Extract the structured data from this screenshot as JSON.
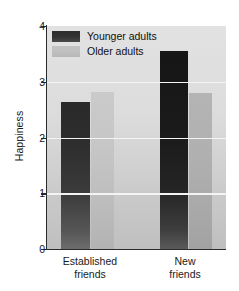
{
  "chart_data": {
    "type": "bar",
    "title": "",
    "xlabel": "",
    "ylabel": "Happiness",
    "ylim": [
      0,
      4
    ],
    "yticks": [
      0,
      1,
      2,
      3,
      4
    ],
    "ytick_labels": [
      "0",
      "1",
      "2",
      "3",
      "4"
    ],
    "grid": true,
    "grid_axis": "y",
    "legend_position": "upper-left-inside",
    "categories": [
      "Established friends",
      "New friends"
    ],
    "category_lines": [
      [
        "Established",
        "friends"
      ],
      [
        "New",
        "friends"
      ]
    ],
    "series": [
      {
        "name": "Younger adults",
        "color": "#2e2e2e",
        "values": [
          2.63,
          3.56
        ]
      },
      {
        "name": "Older adults",
        "color": "#c0c0c0",
        "values": [
          2.82,
          2.8
        ]
      }
    ]
  },
  "legend": {
    "items": [
      {
        "label": "Younger adults",
        "swatch": "younger"
      },
      {
        "label": "Older adults",
        "swatch": "older"
      }
    ]
  },
  "axis": {
    "y_title": "Happiness",
    "y_tick_4": "4",
    "y_tick_3": "3",
    "y_tick_2": "2",
    "y_tick_1": "1",
    "y_tick_0": "0"
  },
  "xlabels": {
    "group1_line1": "Established",
    "group1_line2": "friends",
    "group2_line1": "New",
    "group2_line2": "friends"
  }
}
